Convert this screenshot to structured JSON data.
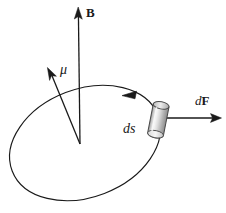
{
  "figure": {
    "domain": "Diagram",
    "canvas": {
      "width": 226,
      "height": 213,
      "background": "#ffffff"
    },
    "colors": {
      "stroke": "#1a1a1a",
      "label": "#1a1a1a",
      "cylinder_light": "#f2f2f2",
      "cylinder_mid": "#c9c9c9",
      "cylinder_dark": "#8f8f8f",
      "background": "#ffffff"
    },
    "labels": {
      "field_vector": "B",
      "dipole_moment": "μ",
      "force_element_d": "d",
      "force_element_F": "F",
      "path_element": "ds"
    },
    "elements": [
      {
        "name": "current-loop",
        "type": "ellipse",
        "center_x": 85,
        "center_y": 143,
        "rx": 78,
        "ry": 54,
        "rotation_deg": -21,
        "direction": "counterclockwise"
      },
      {
        "name": "magnetic-field-arrow",
        "type": "arrow",
        "from_x": 80,
        "from_y": 144,
        "to_x": 78,
        "to_y": 8,
        "label": "B"
      },
      {
        "name": "magnetic-moment-arrow",
        "type": "arrow",
        "from_x": 80,
        "from_y": 144,
        "to_x": 48,
        "to_y": 68,
        "label": "μ"
      },
      {
        "name": "force-arrow",
        "type": "arrow",
        "from_x": 166,
        "from_y": 118,
        "to_x": 221,
        "to_y": 118,
        "label": "dF"
      },
      {
        "name": "current-element-cylinder",
        "type": "cylinder",
        "center_x": 158,
        "center_y": 120,
        "length": 34,
        "diameter": 15,
        "tilt_deg": 12,
        "label": "ds"
      },
      {
        "name": "loop-direction-arrowhead",
        "type": "arrowhead",
        "x": 129,
        "y": 94,
        "angle_deg": 196
      }
    ]
  }
}
